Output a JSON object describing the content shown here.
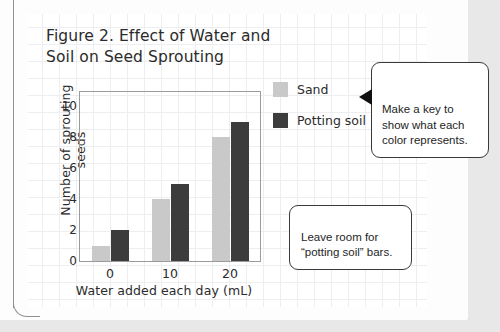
{
  "figure": {
    "title": "Figure 2. Effect of Water and\nSoil on Seed Sprouting"
  },
  "chart_data": {
    "type": "bar",
    "title": "Figure 2. Effect of Water and Soil on Seed Sprouting",
    "xlabel": "Water added each day (mL)",
    "ylabel": "Number of sprouting seeds",
    "categories": [
      "0",
      "10",
      "20"
    ],
    "series": [
      {
        "name": "Sand",
        "color": "#c9c9c9",
        "values": [
          1,
          4,
          8
        ]
      },
      {
        "name": "Potting soil",
        "color": "#3c3c3c",
        "values": [
          2,
          5,
          9
        ]
      }
    ],
    "ylim": [
      0,
      11
    ],
    "yticks": [
      0,
      2,
      4,
      6,
      8,
      10
    ],
    "ytick_labels": [
      "0",
      "2",
      "4",
      "6",
      "8",
      "10"
    ],
    "grid": false,
    "legend_position": "right"
  },
  "legend": {
    "items": [
      {
        "label": "Sand",
        "color": "#c9c9c9"
      },
      {
        "label": "Potting soil",
        "color": "#3c3c3c"
      }
    ]
  },
  "callouts": [
    {
      "id": "key",
      "text": "Make a key to\nshow what each\ncolor represents.",
      "pointer": "left-arrow"
    },
    {
      "id": "room",
      "text": "Leave room for\n“potting soil” bars.",
      "pointer": "none"
    }
  ],
  "colors": {
    "sand": "#c9c9c9",
    "potting_soil": "#3c3c3c",
    "paper": "#ffffff",
    "grid_line": "#eceef0",
    "margin_rule": "#8e9196",
    "ink": "#2b2b2b"
  }
}
